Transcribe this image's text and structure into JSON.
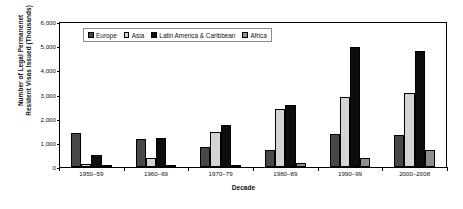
{
  "chart_data": {
    "type": "bar",
    "title": "",
    "xlabel": "Decade",
    "ylabel_line1": "Number of Legal Permanenet",
    "ylabel_line2": "Resident Visas Issued (Thousands)",
    "categories": [
      "1950–59",
      "1960–69",
      "1970–79",
      "1980–89",
      "1990–99",
      "2000–2008"
    ],
    "series": [
      {
        "name": "Europe",
        "color": "#484848",
        "values": [
          1400,
          1140,
          830,
          690,
          1380,
          1340
        ]
      },
      {
        "name": "Asia",
        "color": "#d4d4d4",
        "values": [
          130,
          390,
          1440,
          2400,
          2890,
          3050
        ]
      },
      {
        "name": "Latin America & Caribbean",
        "color": "#0d0d0d",
        "values": [
          510,
          1220,
          1730,
          2560,
          4980,
          4810
        ]
      },
      {
        "name": "Africa",
        "color": "#8f8f8f",
        "values": [
          15,
          30,
          90,
          175,
          390,
          690
        ]
      }
    ],
    "ylim": [
      0,
      6000
    ],
    "ytick_values": [
      0,
      1000,
      2000,
      3000,
      4000,
      5000,
      6000
    ],
    "ytick_labels": [
      "0",
      "1,000",
      "2,000",
      "3,000",
      "4,000",
      "5,000",
      "6,000"
    ],
    "grid": false,
    "legend_position": "top-left-inside",
    "axis_color": "#000000",
    "background_color": "#ffffff"
  }
}
